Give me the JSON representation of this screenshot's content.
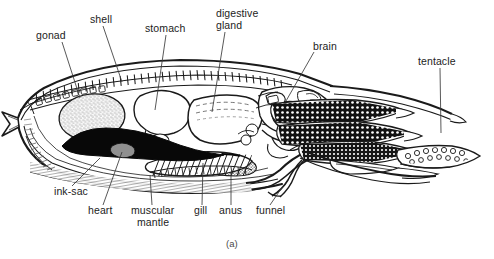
{
  "figure": {
    "caption": "(a)",
    "background_color": "#ffffff",
    "ink_color": "#1a1a1a",
    "label_color": "#1c1c1c"
  },
  "labels": [
    {
      "id": "gonad",
      "text": "gonad",
      "x": 36,
      "y": 36,
      "align": "left"
    },
    {
      "id": "shell",
      "text": "shell",
      "x": 90,
      "y": 20,
      "align": "left"
    },
    {
      "id": "stomach",
      "text": "stomach",
      "x": 145,
      "y": 29,
      "align": "left"
    },
    {
      "id": "digestive",
      "text": "digestive",
      "x": 216,
      "y": 14,
      "align": "left"
    },
    {
      "id": "gland",
      "text": "gland",
      "x": 216,
      "y": 26,
      "align": "left"
    },
    {
      "id": "brain",
      "text": "brain",
      "x": 313,
      "y": 47,
      "align": "left"
    },
    {
      "id": "tentacle",
      "text": "tentacle",
      "x": 418,
      "y": 62,
      "align": "left"
    },
    {
      "id": "ink-sac",
      "text": "ink-sac",
      "x": 54,
      "y": 192,
      "align": "left"
    },
    {
      "id": "heart",
      "text": "heart",
      "x": 88,
      "y": 211,
      "align": "left"
    },
    {
      "id": "muscular",
      "text": "muscular",
      "x": 135,
      "y": 211,
      "align": "left"
    },
    {
      "id": "mantle",
      "text": "mantle",
      "x": 140,
      "y": 223,
      "align": "left"
    },
    {
      "id": "gill",
      "text": "gill",
      "x": 196,
      "y": 211,
      "align": "left"
    },
    {
      "id": "anus",
      "text": "anus",
      "x": 221,
      "y": 211,
      "align": "left"
    },
    {
      "id": "funnel",
      "text": "funnel",
      "x": 258,
      "y": 211,
      "align": "left"
    }
  ],
  "leader_lines": [
    {
      "id": "gonad",
      "x1": 62,
      "y1": 42,
      "x2": 80,
      "y2": 98
    },
    {
      "id": "shell",
      "x1": 103,
      "y1": 26,
      "x2": 122,
      "y2": 82
    },
    {
      "id": "stomach",
      "x1": 166,
      "y1": 35,
      "x2": 155,
      "y2": 110
    },
    {
      "id": "digestive",
      "x1": 225,
      "y1": 32,
      "x2": 212,
      "y2": 112
    },
    {
      "id": "brain",
      "x1": 314,
      "y1": 52,
      "x2": 286,
      "y2": 101
    },
    {
      "id": "tentacle",
      "x1": 440,
      "y1": 68,
      "x2": 441,
      "y2": 133
    },
    {
      "id": "ink-sac",
      "x1": 72,
      "y1": 186,
      "x2": 100,
      "y2": 158
    },
    {
      "id": "heart",
      "x1": 103,
      "y1": 205,
      "x2": 122,
      "y2": 152
    },
    {
      "id": "muscular",
      "x1": 152,
      "y1": 205,
      "x2": 150,
      "y2": 175
    },
    {
      "id": "gill",
      "x1": 202,
      "y1": 205,
      "x2": 203,
      "y2": 163
    },
    {
      "id": "anus",
      "x1": 231,
      "y1": 205,
      "x2": 231,
      "y2": 172
    },
    {
      "id": "funnel",
      "x1": 270,
      "y1": 205,
      "x2": 283,
      "y2": 186
    }
  ],
  "structures": [
    {
      "id": "mantle-outline",
      "name": "muscular mantle wall"
    },
    {
      "id": "shell-segmented",
      "name": "segmented cuttlebone shell"
    },
    {
      "id": "gonad-organ",
      "name": "gonad (stippled oval)"
    },
    {
      "id": "ink-sac-organ",
      "name": "ink sac (solid black)"
    },
    {
      "id": "stomach-organ",
      "name": "stomach"
    },
    {
      "id": "digestive-gland",
      "name": "digestive gland"
    },
    {
      "id": "brain-organ",
      "name": "brain"
    },
    {
      "id": "gill-organ",
      "name": "gill (hatched)"
    },
    {
      "id": "funnel-organ",
      "name": "funnel (siphon)"
    },
    {
      "id": "tentacle-arms",
      "name": "tentacles with suckers"
    },
    {
      "id": "posterior-fin",
      "name": "posterior fin tip"
    }
  ]
}
